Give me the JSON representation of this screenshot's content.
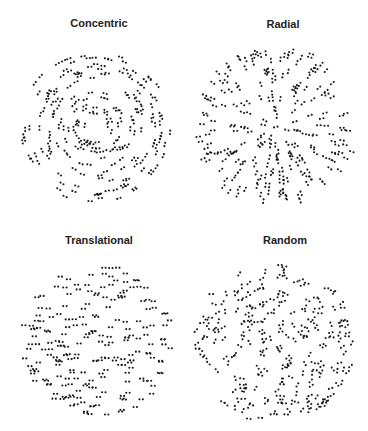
{
  "figure": {
    "panels": [
      {
        "id": "concentric",
        "title": "Concentric",
        "pattern": "concentric",
        "cx": 95,
        "cy": 127,
        "r": 76,
        "title_cx": 99,
        "title_y": 17,
        "pairs": 210,
        "sep": 3.4,
        "seed": 11
      },
      {
        "id": "radial",
        "title": "Radial",
        "pattern": "radial",
        "cx": 276,
        "cy": 127,
        "r": 80,
        "title_cx": 283,
        "title_y": 18,
        "pairs": 230,
        "sep": 3.6,
        "seed": 23
      },
      {
        "id": "translational",
        "title": "Translational",
        "pattern": "translational",
        "cx": 98,
        "cy": 341,
        "r": 76,
        "title_cx": 99,
        "title_y": 234,
        "pairs": 210,
        "sep": 3.4,
        "seed": 37
      },
      {
        "id": "random",
        "title": "Random",
        "pattern": "random",
        "cx": 274,
        "cy": 343,
        "r": 80,
        "title_cx": 285,
        "title_y": 234,
        "pairs": 230,
        "sep": 3.6,
        "seed": 51
      }
    ],
    "dot_color": "#1a1a1a",
    "dot_radius": 1.05
  }
}
